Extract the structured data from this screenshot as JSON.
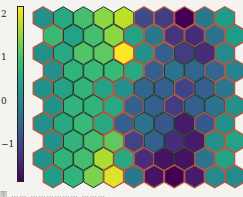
{
  "chart_data": {
    "type": "heatmap",
    "subtype": "hexagonal-som-map",
    "title": "",
    "rows": 10,
    "cols": 10,
    "layout": "pointy-top hexagons, odd rows offset right by half a cell",
    "colormap": "viridis",
    "vmin": -1.8,
    "vmax": 2.2,
    "colorbar": {
      "ticks": [
        2,
        1,
        0,
        -1
      ],
      "tick_labels": [
        "2",
        "1",
        "0",
        "−1"
      ],
      "position": "left"
    },
    "values": [
      [
        0.2,
        0.6,
        1.0,
        1.5,
        1.8,
        -0.9,
        -1.1,
        -1.8,
        -0.2,
        0.4
      ],
      [
        0.9,
        0.5,
        1.0,
        1.5,
        0.5,
        -0.2,
        -1.2,
        -1.3,
        -0.3,
        0.4
      ],
      [
        0.2,
        0.6,
        1.1,
        1.2,
        2.2,
        0.2,
        -0.6,
        -1.1,
        -1.3,
        0.1
      ],
      [
        0.2,
        0.8,
        0.9,
        0.9,
        0.6,
        -0.6,
        -0.3,
        -0.5,
        -0.5,
        0.0
      ],
      [
        0.2,
        0.5,
        0.8,
        0.5,
        0.2,
        -0.5,
        -0.6,
        -1.0,
        -0.6,
        -0.2
      ],
      [
        0.2,
        0.8,
        0.8,
        0.6,
        -0.6,
        -0.6,
        -1.1,
        -0.6,
        -0.3,
        0.2
      ],
      [
        0.2,
        0.6,
        0.9,
        0.6,
        -0.6,
        -0.3,
        -0.7,
        -1.5,
        -0.7,
        0.2
      ],
      [
        0.2,
        0.8,
        1.0,
        1.2,
        -1.0,
        -0.6,
        -1.3,
        -1.5,
        0.2,
        0.5
      ],
      [
        0.2,
        0.8,
        1.0,
        1.7,
        0.6,
        -1.3,
        -1.6,
        -1.6,
        -0.3,
        0.5
      ],
      [
        0.4,
        0.8,
        1.4,
        2.0,
        -0.2,
        -1.6,
        -1.8,
        -1.5,
        0.1,
        0.1
      ]
    ],
    "boundary_cells": [
      [
        0,
        0
      ],
      [
        0,
        5
      ],
      [
        0,
        6
      ],
      [
        0,
        7
      ],
      [
        0,
        8
      ],
      [
        0,
        9
      ],
      [
        1,
        0
      ],
      [
        1,
        4
      ],
      [
        1,
        5
      ],
      [
        1,
        6
      ],
      [
        1,
        7
      ],
      [
        1,
        8
      ],
      [
        1,
        9
      ],
      [
        2,
        0
      ],
      [
        2,
        4
      ],
      [
        2,
        5
      ],
      [
        2,
        6
      ],
      [
        2,
        9
      ],
      [
        3,
        0
      ],
      [
        3,
        4
      ],
      [
        3,
        5
      ],
      [
        3,
        8
      ],
      [
        3,
        9
      ],
      [
        4,
        0
      ],
      [
        4,
        3
      ],
      [
        4,
        4
      ],
      [
        4,
        7
      ],
      [
        4,
        9
      ],
      [
        5,
        0
      ],
      [
        5,
        3
      ],
      [
        5,
        4
      ],
      [
        5,
        6
      ],
      [
        5,
        9
      ],
      [
        6,
        0
      ],
      [
        6,
        3
      ],
      [
        6,
        4
      ],
      [
        6,
        8
      ],
      [
        6,
        9
      ],
      [
        7,
        0
      ],
      [
        7,
        3
      ],
      [
        7,
        4
      ],
      [
        7,
        8
      ],
      [
        7,
        9
      ],
      [
        8,
        0
      ],
      [
        8,
        4
      ],
      [
        8,
        5
      ],
      [
        8,
        8
      ],
      [
        8,
        9
      ],
      [
        9,
        0
      ],
      [
        9,
        3
      ],
      [
        9,
        4
      ],
      [
        9,
        5
      ],
      [
        9,
        6
      ],
      [
        9,
        7
      ],
      [
        9,
        8
      ],
      [
        9,
        9
      ]
    ],
    "xlabel": "",
    "ylabel": "",
    "grid": false
  },
  "style": {
    "inner_edge_color": "#1c3b28",
    "boundary_edge_color": "#b4583c",
    "background": "#f4f3f0"
  },
  "caption": {
    "text": "图  ……  ………………  ………"
  }
}
